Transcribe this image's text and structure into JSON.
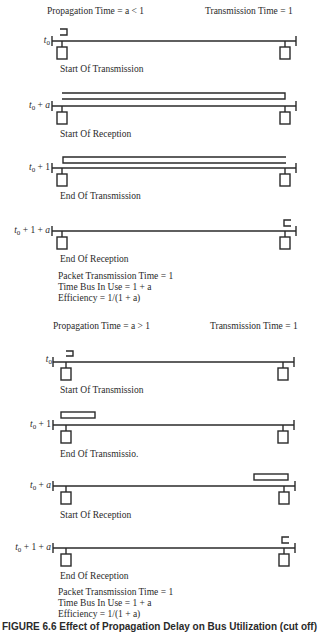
{
  "scenario_1": {
    "header_left": "Propagation Time = a < 1",
    "header_right": "Transmission Time = 1",
    "panels": [
      {
        "time_label": "t0",
        "caption": "Start Of Transmission"
      },
      {
        "time_label": "t0 + a",
        "caption": "Start Of Reception"
      },
      {
        "time_label": "t0 + 1",
        "caption": "End Of Transmission"
      },
      {
        "time_label": "t0 + 1 + a",
        "caption": "End Of Reception"
      }
    ],
    "summary": [
      "Packet Transmission Time = 1",
      "Time Bus In Use = 1 + a",
      "Efficiency = 1/(1 + a)"
    ]
  },
  "scenario_2": {
    "header_left": "Propagation Time = a > 1",
    "header_right": "Transmission Time = 1",
    "panels": [
      {
        "time_label": "t0",
        "caption": "Start Of Transmission"
      },
      {
        "time_label": "t0 + 1",
        "caption": "End Of Transmissio."
      },
      {
        "time_label": "t0 + a",
        "caption": "Start Of Reception"
      },
      {
        "time_label": "t0 + 1 + a",
        "caption": "End Of Reception"
      }
    ],
    "summary": [
      "Packet Transmission Time = 1",
      "Time Bus In Use = 1 + a",
      "Efficiency = 1/(1 + a)"
    ]
  },
  "figure_caption": "FIGURE 6.6 Effect of Propagation Delay on Bus Utilization (cut off)"
}
